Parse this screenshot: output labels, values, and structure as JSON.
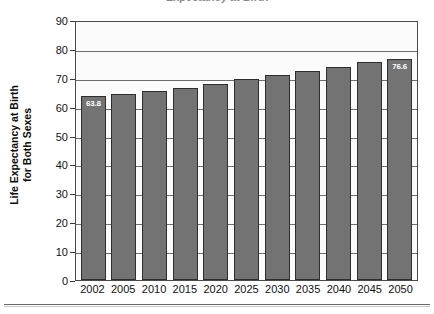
{
  "figure": {
    "title_cutoff": "Expectancy at Birth",
    "footer_rule": true
  },
  "chart_data": {
    "type": "bar",
    "title": "",
    "xlabel": "",
    "ylabel": "Life Expectancy at Birth for Both Sexes",
    "ylabel_line1": "Life Expectancy at Birth",
    "ylabel_line2": "for Both Sexes",
    "categories": [
      "2002",
      "2005",
      "2010",
      "2015",
      "2020",
      "2025",
      "2030",
      "2035",
      "2040",
      "2045",
      "2050"
    ],
    "values": [
      63.8,
      64.3,
      65.3,
      66.6,
      68.0,
      69.6,
      70.9,
      72.2,
      73.8,
      75.5,
      76.6
    ],
    "point_labels": [
      "63.8",
      "",
      "",
      "",
      "",
      "",
      "",
      "",
      "",
      "",
      "76.6"
    ],
    "ylim": [
      0,
      90
    ],
    "ytick_step": 10,
    "yticks": [
      "90",
      "80",
      "70",
      "60",
      "50",
      "40",
      "30",
      "20",
      "10",
      "0"
    ],
    "grid": true,
    "legend": false,
    "bar_color": "#737373",
    "bar_border_color": "#2e2e2e",
    "label_text_color": "#ffffff",
    "plot_background": "#fbfbfb",
    "axis_color": "#4a4a4a"
  }
}
